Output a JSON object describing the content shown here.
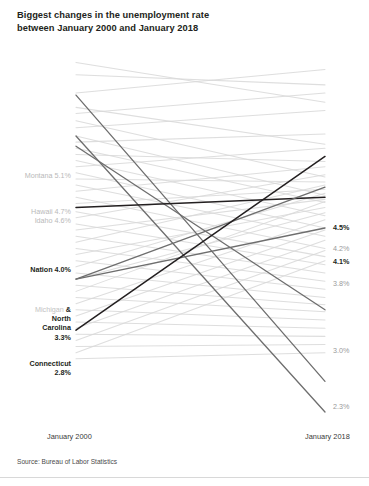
{
  "title": {
    "line1": "Biggest changes in the unemployment rate",
    "line2": "between January 2000 and January 2018"
  },
  "axis": {
    "left_label": "January 2000",
    "right_label": "January 2018"
  },
  "source": "Source: Bureau of Labor Statistics",
  "colors": {
    "background_line": "#d9d9d9",
    "highlight_dark": "#231f20",
    "highlight_mid": "#6e6e6e",
    "label_gray": "#b9b9b9",
    "label_dark": "#231f20",
    "page_background": "#ffffff"
  },
  "left_labels": [
    {
      "name": "montana",
      "text": "Montana 5.1%",
      "style": "gray",
      "y": 172
    },
    {
      "name": "hawaii",
      "text": "Hawaii 4.7%",
      "style": "gray",
      "y": 208
    },
    {
      "name": "idaho",
      "text": "Idaho 4.6%",
      "style": "gray",
      "y": 217
    },
    {
      "name": "nation",
      "text": "Nation 4.0%",
      "style": "dark",
      "y": 266
    },
    {
      "name": "connecticut",
      "text": "Connecticut",
      "style": "dark",
      "y": 360
    },
    {
      "name": "connecticut-value",
      "text": "2.8%",
      "style": "dark",
      "y": 369
    }
  ],
  "michigan_nc_block": {
    "michigan": "Michigan",
    "amp": "&",
    "north": "North",
    "carolina": "Carolina",
    "value": "3.3%"
  },
  "right_labels": [
    {
      "name": "r-45",
      "text": "4.5%",
      "style": "dark",
      "y": 224
    },
    {
      "name": "r-42",
      "text": "4.2%",
      "style": "gray",
      "y": 245
    },
    {
      "name": "r-41",
      "text": "4.1%",
      "style": "dark",
      "y": 258
    },
    {
      "name": "r-38",
      "text": "3.8%",
      "style": "gray",
      "y": 280
    },
    {
      "name": "r-30",
      "text": "3.0%",
      "style": "gray",
      "y": 347
    },
    {
      "name": "r-23",
      "text": "2.3%",
      "style": "gray",
      "y": 403
    }
  ],
  "chart_data": {
    "type": "line",
    "subtype": "slope-chart",
    "title": "Biggest changes in the unemployment rate between January 2000 and January 2018",
    "xlabel": "",
    "ylabel": "Unemployment rate (%)",
    "x": [
      "January 2000",
      "January 2018"
    ],
    "xlim": [
      0,
      1
    ],
    "ylim": [
      2.0,
      5.6
    ],
    "y_inverted": true,
    "grid": false,
    "legend": "none",
    "source": "Source: Bureau of Labor Statistics",
    "highlighted_series": [
      {
        "name": "Montana",
        "values": [
          5.1,
          2.3
        ],
        "emphasis": "mid",
        "label_left": "Montana 5.1%",
        "label_right": "2.3%"
      },
      {
        "name": "Hawaii",
        "values": [
          4.7,
          2.0
        ],
        "emphasis": "mid",
        "label_left": "Hawaii 4.7%",
        "label_right": ""
      },
      {
        "name": "Idaho",
        "values": [
          4.6,
          3.0
        ],
        "emphasis": "mid",
        "label_left": "Idaho 4.6%",
        "label_right": "3.0%"
      },
      {
        "name": "Nation",
        "values": [
          4.0,
          4.1
        ],
        "emphasis": "dark",
        "label_left": "Nation 4.0%",
        "label_right": "4.1%"
      },
      {
        "name": "Michigan",
        "values": [
          3.3,
          4.2
        ],
        "emphasis": "mid",
        "label_left": "Michigan",
        "label_right": "4.2%"
      },
      {
        "name": "North Carolina",
        "values": [
          3.3,
          3.8
        ],
        "emphasis": "mid",
        "label_left": "North Carolina 3.3%",
        "label_right": "3.8%"
      },
      {
        "name": "Connecticut",
        "values": [
          2.8,
          4.5
        ],
        "emphasis": "dark",
        "label_left": "Connecticut 2.8%",
        "label_right": "4.5%"
      }
    ],
    "background_series": [
      {
        "values": [
          5.42,
          5.03
        ]
      },
      {
        "values": [
          5.3,
          5.2
        ]
      },
      {
        "values": [
          5.12,
          5.35
        ]
      },
      {
        "values": [
          4.98,
          4.62
        ]
      },
      {
        "values": [
          4.92,
          5.12
        ]
      },
      {
        "values": [
          4.85,
          4.3
        ]
      },
      {
        "values": [
          4.78,
          4.95
        ]
      },
      {
        "values": [
          4.7,
          4.12
        ]
      },
      {
        "values": [
          4.64,
          4.72
        ]
      },
      {
        "values": [
          4.58,
          4.05
        ]
      },
      {
        "values": [
          4.52,
          4.45
        ]
      },
      {
        "values": [
          4.46,
          3.92
        ]
      },
      {
        "values": [
          4.4,
          4.58
        ]
      },
      {
        "values": [
          4.34,
          3.8
        ]
      },
      {
        "values": [
          4.28,
          4.25
        ]
      },
      {
        "values": [
          4.22,
          3.72
        ]
      },
      {
        "values": [
          4.16,
          4.4
        ]
      },
      {
        "values": [
          4.1,
          3.6
        ]
      },
      {
        "values": [
          4.04,
          4.18
        ]
      },
      {
        "values": [
          3.96,
          3.52
        ]
      },
      {
        "values": [
          3.9,
          4.32
        ]
      },
      {
        "values": [
          3.84,
          3.44
        ]
      },
      {
        "values": [
          3.78,
          4.08
        ]
      },
      {
        "values": [
          3.72,
          3.36
        ]
      },
      {
        "values": [
          3.66,
          4.22
        ]
      },
      {
        "values": [
          3.6,
          3.28
        ]
      },
      {
        "values": [
          3.54,
          4.0
        ]
      },
      {
        "values": [
          3.48,
          3.2
        ]
      },
      {
        "values": [
          3.42,
          4.14
        ]
      },
      {
        "values": [
          3.36,
          3.12
        ]
      },
      {
        "values": [
          3.3,
          3.95
        ]
      },
      {
        "values": [
          3.24,
          3.05
        ]
      },
      {
        "values": [
          3.18,
          4.06
        ]
      },
      {
        "values": [
          3.12,
          2.98
        ]
      },
      {
        "values": [
          3.06,
          3.88
        ]
      },
      {
        "values": [
          3.0,
          2.9
        ]
      },
      {
        "values": [
          2.94,
          3.78
        ]
      },
      {
        "values": [
          2.88,
          2.82
        ]
      },
      {
        "values": [
          2.82,
          3.68
        ]
      },
      {
        "values": [
          2.76,
          2.74
        ]
      },
      {
        "values": [
          2.7,
          3.58
        ]
      },
      {
        "values": [
          2.64,
          2.66
        ]
      },
      {
        "values": [
          2.58,
          3.48
        ]
      },
      {
        "values": [
          2.52,
          2.58
        ]
      }
    ]
  }
}
